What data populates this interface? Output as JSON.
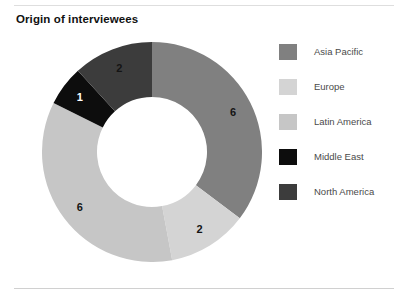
{
  "chart_title": "Origin of interviewees",
  "chart_data": {
    "type": "pie",
    "title": "Origin of interviewees",
    "xlabel": "",
    "ylabel": "",
    "legend_position": "right",
    "grid": false,
    "donut": true,
    "inner_radius_ratio": 0.5,
    "total": 17,
    "start_angle_deg": 0,
    "direction": "clockwise",
    "categories": [
      "Asia Pacific",
      "Europe",
      "Latin America",
      "Middle East",
      "North America"
    ],
    "values": [
      6,
      2,
      6,
      1,
      2
    ],
    "labels": [
      "6",
      "2",
      "6",
      "1",
      "2"
    ],
    "colors": [
      "#808080",
      "#d4d4d4",
      "#c6c6c6",
      "#0d0d0d",
      "#3c3c3c"
    ],
    "label_colors": [
      "#141414",
      "#141414",
      "#141414",
      "#ffffff",
      "#141414"
    ],
    "slices": [
      {
        "name": "Asia Pacific",
        "value": 6,
        "label": "6",
        "color": "#808080",
        "label_color": "#141414"
      },
      {
        "name": "Europe",
        "value": 2,
        "label": "2",
        "color": "#d4d4d4",
        "label_color": "#141414"
      },
      {
        "name": "Latin America",
        "value": 6,
        "label": "6",
        "color": "#c6c6c6",
        "label_color": "#141414"
      },
      {
        "name": "Middle East",
        "value": 1,
        "label": "1",
        "color": "#0d0d0d",
        "label_color": "#ffffff"
      },
      {
        "name": "North America",
        "value": 2,
        "label": "2",
        "color": "#3c3c3c",
        "label_color": "#141414"
      }
    ]
  },
  "legend": {
    "items": [
      {
        "label": "Asia Pacific",
        "color": "#808080"
      },
      {
        "label": "Europe",
        "color": "#d4d4d4"
      },
      {
        "label": "Latin America",
        "color": "#c6c6c6"
      },
      {
        "label": "Middle East",
        "color": "#0d0d0d"
      },
      {
        "label": "North America",
        "color": "#3c3c3c"
      }
    ]
  }
}
